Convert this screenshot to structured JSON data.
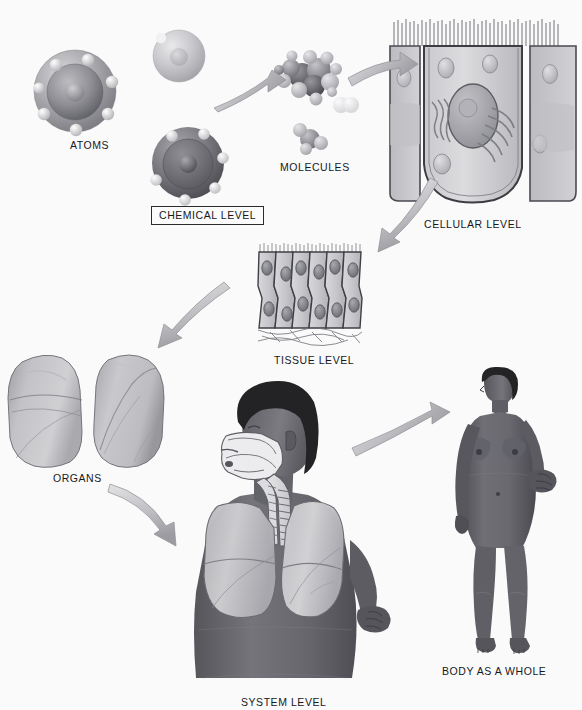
{
  "figure": {
    "background_color": "#fafafa",
    "style": "grayscale anatomical illustration"
  },
  "labels": [
    {
      "id": "atoms",
      "text": "ATOMS",
      "x": 70,
      "y": 139,
      "boxed": false
    },
    {
      "id": "chemical",
      "text": "CHEMICAL LEVEL",
      "x": 151,
      "y": 208,
      "boxed": true
    },
    {
      "id": "molecules",
      "text": "MOLECULES",
      "x": 280,
      "y": 161,
      "boxed": false
    },
    {
      "id": "cellular",
      "text": "CELLULAR LEVEL",
      "x": 424,
      "y": 218,
      "boxed": false
    },
    {
      "id": "tissue",
      "text": "TISSUE LEVEL",
      "x": 274,
      "y": 354,
      "boxed": false
    },
    {
      "id": "organs",
      "text": "ORGANS",
      "x": 53,
      "y": 472,
      "boxed": false
    },
    {
      "id": "system",
      "text": "SYSTEM LEVEL",
      "x": 241,
      "y": 696,
      "boxed": false
    },
    {
      "id": "body",
      "text": "BODY AS A WHOLE",
      "x": 442,
      "y": 665,
      "boxed": false
    }
  ],
  "levels": [
    {
      "key": "chemical",
      "label": "CHEMICAL LEVEL",
      "items": [
        "ATOMS",
        "MOLECULES"
      ]
    },
    {
      "key": "cellular",
      "label": "CELLULAR LEVEL",
      "items": [
        "epithelial cell",
        "nucleus",
        "microvilli",
        "golgi apparatus",
        "vesicles"
      ]
    },
    {
      "key": "tissue",
      "label": "TISSUE LEVEL",
      "items": [
        "pseudostratified columnar epithelium"
      ]
    },
    {
      "key": "organ",
      "label": "ORGANS",
      "items": [
        "lungs"
      ]
    },
    {
      "key": "system",
      "label": "SYSTEM LEVEL",
      "items": [
        "respiratory system",
        "nasal cavity",
        "trachea",
        "lungs"
      ]
    },
    {
      "key": "organism",
      "label": "BODY AS A WHOLE",
      "items": [
        "human female figure"
      ]
    }
  ],
  "arrows": [
    {
      "id": "atoms-to-molecules",
      "from": "ATOMS",
      "to": "MOLECULES",
      "direction": "right"
    },
    {
      "id": "molecules-to-cell",
      "from": "MOLECULES",
      "to": "CELLULAR LEVEL",
      "direction": "right"
    },
    {
      "id": "cell-to-tissue",
      "from": "CELLULAR LEVEL",
      "to": "TISSUE LEVEL",
      "direction": "down-left"
    },
    {
      "id": "tissue-to-organs",
      "from": "TISSUE LEVEL",
      "to": "ORGANS",
      "direction": "down-left"
    },
    {
      "id": "organs-to-system",
      "from": "ORGANS",
      "to": "SYSTEM LEVEL",
      "direction": "down-right"
    },
    {
      "id": "system-to-body",
      "from": "SYSTEM LEVEL",
      "to": "BODY AS A WHOLE",
      "direction": "right"
    }
  ],
  "colors": {
    "background": "#fafafa",
    "ink": "#18181a",
    "arrow_fill": "#b9b9bc",
    "arrow_stroke": "#8d8d91",
    "atom_dark": "#6f6f74",
    "atom_light": "#c3c3c7",
    "cell_fill": "#cfcfd2",
    "tissue_fill": "#c8c8cb",
    "lung_fill": "#b4b4b7",
    "skin": "#6a6a6e",
    "hair": "#232326"
  }
}
